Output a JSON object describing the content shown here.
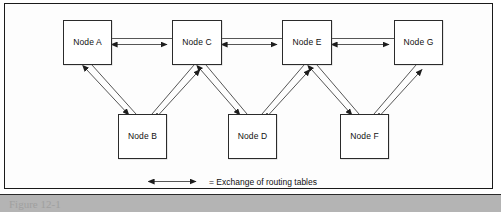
{
  "figure": {
    "background_color": "#ffffff",
    "frame_color": "#1a1a1a",
    "line_color": "#2b2b2b"
  },
  "diagram": {
    "type": "network-topology",
    "title": "",
    "nodes": [
      {
        "id": "A",
        "label": "Node A",
        "row": "top",
        "x": 63,
        "y": 20,
        "w": 49,
        "h": 45
      },
      {
        "id": "C",
        "label": "Node C",
        "row": "top",
        "x": 172,
        "y": 20,
        "w": 50,
        "h": 45
      },
      {
        "id": "E",
        "label": "Node E",
        "row": "top",
        "x": 282,
        "y": 20,
        "w": 50,
        "h": 45
      },
      {
        "id": "G",
        "label": "Node G",
        "row": "top",
        "x": 394,
        "y": 20,
        "w": 49,
        "h": 45
      },
      {
        "id": "B",
        "label": "Node B",
        "row": "bottom",
        "x": 118,
        "y": 114,
        "w": 49,
        "h": 45
      },
      {
        "id": "D",
        "label": "Node D",
        "row": "bottom",
        "x": 228,
        "y": 114,
        "w": 49,
        "h": 45
      },
      {
        "id": "F",
        "label": "Node F",
        "row": "bottom",
        "x": 340,
        "y": 114,
        "w": 49,
        "h": 45
      }
    ],
    "links": [
      {
        "from": "A",
        "to": "C",
        "kind": "horizontal",
        "bidirectional": true
      },
      {
        "from": "C",
        "to": "E",
        "kind": "horizontal",
        "bidirectional": true
      },
      {
        "from": "E",
        "to": "G",
        "kind": "horizontal",
        "bidirectional": true
      },
      {
        "from": "A",
        "to": "B",
        "kind": "diagonal",
        "bidirectional": true
      },
      {
        "from": "B",
        "to": "C",
        "kind": "diagonal",
        "bidirectional": true
      },
      {
        "from": "C",
        "to": "D",
        "kind": "diagonal",
        "bidirectional": true
      },
      {
        "from": "D",
        "to": "E",
        "kind": "diagonal",
        "bidirectional": true
      },
      {
        "from": "E",
        "to": "F",
        "kind": "diagonal",
        "bidirectional": true
      },
      {
        "from": "F",
        "to": "G",
        "kind": "diagonal",
        "bidirectional": true
      }
    ]
  },
  "legend": {
    "symbol": "double-headed-arrow",
    "text": "= Exchange of routing tables"
  },
  "caption": {
    "text": "Figure 12-1"
  }
}
